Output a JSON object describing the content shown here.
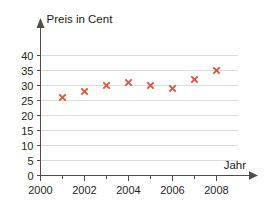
{
  "chart_data": {
    "type": "scatter",
    "title": "",
    "subtitle": "",
    "xlabel": "Jahr",
    "ylabel": "Preis in Cent",
    "x": [
      2001,
      2002,
      2003,
      2004,
      2005,
      2006,
      2007,
      2008
    ],
    "values": [
      26,
      28,
      30,
      31,
      30,
      29,
      32,
      35
    ],
    "series": [
      {
        "name": "Preis in Cent",
        "marker": "x-cross",
        "color": "#e0563a",
        "points": [
          {
            "x": 2001,
            "y": 26
          },
          {
            "x": 2002,
            "y": 28
          },
          {
            "x": 2003,
            "y": 30
          },
          {
            "x": 2004,
            "y": 31
          },
          {
            "x": 2005,
            "y": 30
          },
          {
            "x": 2006,
            "y": 29
          },
          {
            "x": 2007,
            "y": 32
          },
          {
            "x": 2008,
            "y": 35
          }
        ]
      }
    ],
    "xlim": [
      2000,
      2009
    ],
    "ylim": [
      0,
      41
    ],
    "x_tick_labels": [
      "2000",
      "2002",
      "2004",
      "2006",
      "2008"
    ],
    "x_tick_values": [
      2000,
      2002,
      2004,
      2006,
      2008
    ],
    "x_minor_tick_values": [
      2001,
      2003,
      2005,
      2007
    ],
    "y_tick_labels": [
      "0",
      "5",
      "10",
      "15",
      "20",
      "25",
      "30",
      "35",
      "40"
    ],
    "y_tick_values": [
      0,
      5,
      10,
      15,
      20,
      25,
      30,
      35,
      40
    ],
    "grid": "horizontal",
    "grid_color": "#dcdcdc",
    "legend": "none",
    "legend_position": "none",
    "axis_color": "#4d4d4d",
    "background_color": "#ffffff",
    "axis_arrows": true,
    "annotations": []
  },
  "labels": {
    "y_axis_title": "Preis in Cent",
    "x_axis_title": "Jahr"
  }
}
